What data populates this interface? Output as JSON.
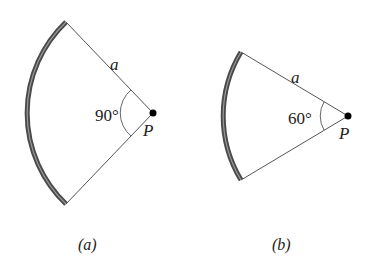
{
  "figures": [
    {
      "id": "a",
      "caption": "(a)",
      "angle_label": "90°",
      "radius_label": "a",
      "point_label": "P",
      "angle_deg": 90,
      "center": [
        153,
        113
      ],
      "radius": 126
    },
    {
      "id": "b",
      "caption": "(b)",
      "angle_label": "60°",
      "radius_label": "a",
      "point_label": "P",
      "angle_deg": 60,
      "center": [
        348,
        116
      ],
      "radius": 124
    }
  ],
  "colors": {
    "rod": "#555555",
    "rod_highlight": "#9a9a9a",
    "line": "#444444",
    "point": "#000000"
  }
}
